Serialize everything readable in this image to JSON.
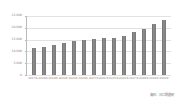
{
  "chart_data": {
    "type": "bar",
    "title": "",
    "xlabel": "",
    "ylabel": "",
    "ylim": [
      0,
      25000
    ],
    "grid": true,
    "legend": false,
    "bar_color": "#7f7f7f",
    "categories": [
      "2017年",
      "2018年",
      "2019年",
      "2020年",
      "2021年",
      "2022年",
      "2023年",
      "2024年",
      "2025年",
      "2026年",
      "2027年",
      "2028年",
      "2029年",
      "2030年"
    ],
    "values": [
      11500,
      11900,
      12700,
      13400,
      14300,
      14700,
      15400,
      15500,
      15600,
      16600,
      18100,
      19500,
      21500,
      23400
    ],
    "ytick_labels": [
      "25,000",
      "20,000",
      "15,000",
      "10,000",
      "5,000",
      "0"
    ],
    "ytick_values": [
      25000,
      20000,
      15000,
      10000,
      5000,
      0
    ]
  },
  "footer": {
    "source_label": "資料：日口問題研"
  }
}
